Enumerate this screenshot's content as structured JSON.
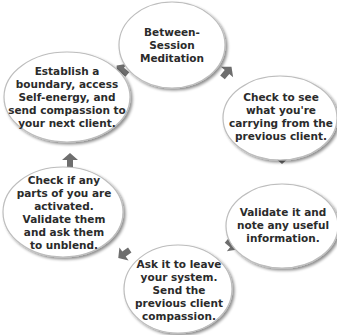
{
  "diagram": {
    "type": "cycle",
    "direction": "clockwise",
    "colors": {
      "node_fill": "#ffffff",
      "node_border": "#bdbdbd",
      "node_shadow": "#8a8a8a",
      "arrow": "#6e6e6e",
      "text": "#2b2b2b"
    },
    "nodes": [
      {
        "id": "meditation",
        "label": "Between-\nSession\nMeditation"
      },
      {
        "id": "check-carrying",
        "label": "Check to see\nwhat you're\ncarrying from the\nprevious client."
      },
      {
        "id": "validate",
        "label": "Validate it and\nnote any useful\ninformation."
      },
      {
        "id": "ask-leave",
        "label": "Ask it to leave\nyour system.\nSend the\nprevious client\ncompassion."
      },
      {
        "id": "check-parts",
        "label": "Check if any\nparts of you are\nactivated.\nValidate them\nand ask them\nto unblend."
      },
      {
        "id": "boundary",
        "label": "Establish a\nboundary, access\nSelf-energy, and\nsend compassion to\nyour next client."
      }
    ],
    "edges": [
      {
        "from": "meditation",
        "to": "check-carrying"
      },
      {
        "from": "check-carrying",
        "to": "validate"
      },
      {
        "from": "validate",
        "to": "ask-leave"
      },
      {
        "from": "ask-leave",
        "to": "check-parts"
      },
      {
        "from": "check-parts",
        "to": "boundary"
      },
      {
        "from": "boundary",
        "to": "meditation"
      }
    ]
  }
}
